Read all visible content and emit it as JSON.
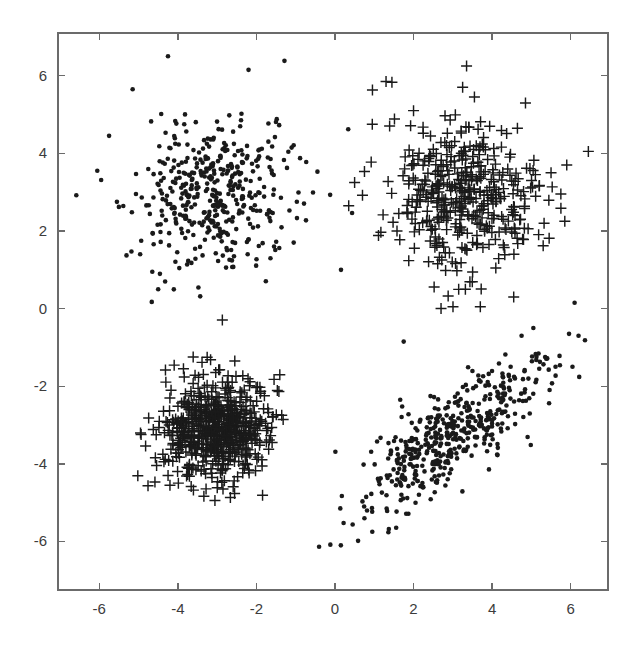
{
  "figure": {
    "title": "",
    "background_color": "#ffffff",
    "axis_color": "#6b6b6b",
    "marker_color": "#1a1a1a"
  },
  "chart_data": {
    "type": "scatter",
    "title": "",
    "subtitle": "",
    "xlabel": "",
    "ylabel": "",
    "xlim": [
      -7.05,
      6.95
    ],
    "ylim": [
      -7.25,
      7.1
    ],
    "xticks": [
      -6,
      -4,
      -2,
      0,
      2,
      4,
      6
    ],
    "xticklabels": [
      "-6",
      "-4",
      "-2",
      "0",
      "2",
      "4",
      "6"
    ],
    "yticks": [
      -6,
      -4,
      -2,
      0,
      2,
      4,
      6
    ],
    "yticklabels": [
      "-6",
      "-4",
      "-2",
      "0",
      "2",
      "4",
      "6"
    ],
    "grid": false,
    "legend": null,
    "legend_position": "none",
    "annotations": [],
    "marker_styles": {
      "dot": {
        "shape": "filled-circle",
        "size_px": 4.6,
        "color": "#1a1a1a"
      },
      "plus": {
        "shape": "plus",
        "size_px": 11.0,
        "color": "#1a1a1a"
      }
    },
    "series": [
      {
        "name": "cluster-upper-left",
        "marker": "dot",
        "n_points": 430,
        "center": [
          -3.1,
          3.0
        ],
        "cov": [
          [
            1.02,
            0.04
          ],
          [
            0.04,
            0.97
          ]
        ],
        "seed": 11,
        "outliers": [
          [
            -6.05,
            3.55
          ],
          [
            -5.75,
            4.45
          ],
          [
            -5.55,
            2.75
          ],
          [
            -5.5,
            2.62
          ],
          [
            -4.25,
            6.5
          ],
          [
            -2.2,
            6.15
          ],
          [
            -5.15,
            5.65
          ],
          [
            -1.05,
            1.7
          ],
          [
            -1.55,
            1.6
          ],
          [
            -4.5,
            0.5
          ],
          [
            -4.65,
            0.95
          ]
        ]
      },
      {
        "name": "cluster-upper-right",
        "marker": "plus",
        "n_points": 410,
        "center": [
          3.2,
          2.9
        ],
        "cov": [
          [
            0.93,
            -0.06
          ],
          [
            -0.06,
            0.88
          ]
        ],
        "seed": 23,
        "outliers": [
          [
            6.45,
            4.05
          ],
          [
            5.9,
            3.7
          ],
          [
            5.5,
            3.5
          ],
          [
            5.75,
            2.95
          ],
          [
            5.85,
            2.25
          ],
          [
            5.3,
            1.62
          ],
          [
            4.55,
            0.3
          ],
          [
            3.7,
            0.05
          ],
          [
            2.7,
            0.0
          ],
          [
            0.5,
            3.25
          ],
          [
            0.35,
            2.65
          ],
          [
            1.3,
            5.85
          ],
          [
            1.45,
            5.83
          ],
          [
            3.35,
            6.25
          ],
          [
            3.25,
            5.7
          ],
          [
            3.55,
            5.45
          ],
          [
            2.0,
            5.1
          ],
          [
            0.95,
            4.75
          ]
        ]
      },
      {
        "name": "cluster-lower-left",
        "marker": "plus",
        "n_points": 620,
        "center": [
          -3.0,
          -3.1
        ],
        "cov": [
          [
            0.44,
            0.02
          ],
          [
            0.02,
            0.42
          ]
        ],
        "seed": 37,
        "outliers": [
          [
            -2.55,
            -1.35
          ],
          [
            -3.35,
            -1.7
          ],
          [
            -4.2,
            -4.55
          ],
          [
            -2.85,
            -4.65
          ],
          [
            -4.55,
            -3.25
          ],
          [
            -1.6,
            -3.45
          ]
        ]
      },
      {
        "name": "cluster-lower-right",
        "marker": "dot",
        "n_points": 470,
        "center": [
          3.0,
          -3.25
        ],
        "cov": [
          [
            1.35,
            0.98
          ],
          [
            0.98,
            1.05
          ]
        ],
        "seed": 53,
        "outliers": [
          [
            0.15,
            -6.1
          ],
          [
            0.95,
            -5.75
          ],
          [
            0.75,
            -5.4
          ],
          [
            5.35,
            -1.25
          ],
          [
            5.05,
            -0.5
          ],
          [
            4.75,
            -0.7
          ],
          [
            1.75,
            -0.85
          ],
          [
            6.1,
            0.15
          ],
          [
            6.2,
            -0.7
          ],
          [
            5.2,
            -1.55
          ]
        ]
      }
    ]
  }
}
